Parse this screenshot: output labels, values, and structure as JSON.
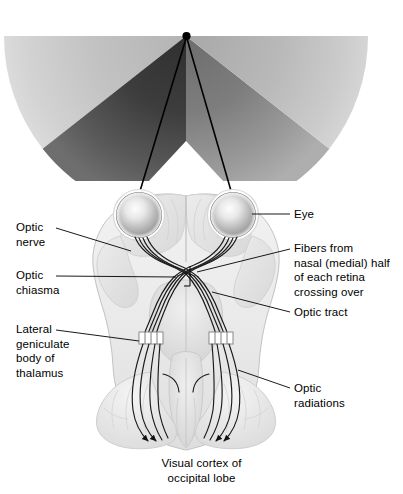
{
  "figure": {
    "background_color": "#ffffff",
    "width": 403,
    "height": 494,
    "line_color": "#000000"
  },
  "visual_field": {
    "apex_label": "fixation-point",
    "sectors": [
      {
        "name": "left-monocular-crescent",
        "tone": "#c9c9c9"
      },
      {
        "name": "left-binocular-field",
        "tone": "#4a4a4a"
      },
      {
        "name": "right-binocular-field",
        "tone": "#8e8e8e"
      },
      {
        "name": "right-monocular-crescent",
        "tone": "#bdbdbd"
      }
    ]
  },
  "labels": {
    "eye": "Eye",
    "optic_nerve": "Optic\nnerve",
    "optic_chiasma": "Optic\nchiasma",
    "lateral_geniculate": "Lateral\ngeniculate\nbody of\nthalamus",
    "fibers_crossing": "Fibers from\nnasal (medial) half\nof each retina\ncrossing over",
    "optic_tract": "Optic tract",
    "optic_radiations": "Optic\nradiations",
    "visual_cortex": "Visual cortex of\noccipital lobe"
  },
  "structures": {
    "left_eye": "left-eyeball",
    "right_eye": "right-eyeball",
    "brain": "brain-inferior-surface",
    "chiasma": "optic-chiasma-crossing",
    "lgn_left": "left-lateral-geniculate-body",
    "lgn_right": "right-lateral-geniculate-body",
    "occipital_left": "left-occipital-lobe",
    "occipital_right": "right-occipital-lobe"
  }
}
